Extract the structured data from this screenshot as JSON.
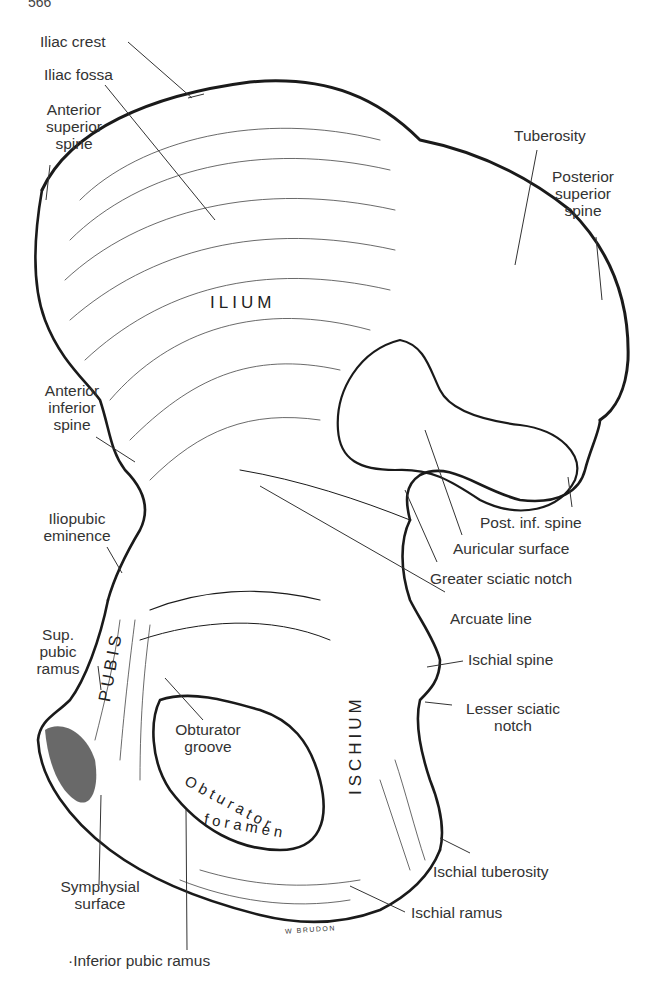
{
  "figure": {
    "page_number_fragment": "566",
    "signature": "W BRUDON",
    "colors": {
      "ink": "#1a1a1a",
      "label_text": "#333333",
      "background": "#ffffff"
    }
  },
  "regions": [
    {
      "id": "ilium",
      "text": "ILIUM"
    },
    {
      "id": "pubis",
      "text": "PUBIS"
    },
    {
      "id": "ischium",
      "text": "ISCHIUM"
    },
    {
      "id": "obturator-foramen",
      "line1": "Obturator",
      "line2": "foramen"
    }
  ],
  "labels": {
    "iliac_crest": "Iliac crest",
    "iliac_fossa": "Iliac fossa",
    "anterior_superior_spine": [
      "Anterior",
      "superior",
      "spine"
    ],
    "tuberosity": "Tuberosity",
    "posterior_superior_spine": [
      "Posterior",
      "superior",
      "spine"
    ],
    "anterior_inferior_spine": [
      "Anterior",
      "inferior",
      "spine"
    ],
    "iliopubic_eminence": [
      "Iliopubic",
      "eminence"
    ],
    "post_inf_spine": "Post. inf. spine",
    "auricular_surface": "Auricular surface",
    "greater_sciatic_notch": "Greater sciatic notch",
    "arcuate_line": "Arcuate line",
    "sup_pubic_ramus": [
      "Sup.",
      "pubic",
      "ramus"
    ],
    "ischial_spine": "Ischial spine",
    "lesser_sciatic_notch": [
      "Lesser sciatic",
      "notch"
    ],
    "obturator_groove": [
      "Obturator",
      "groove"
    ],
    "ischial_tuberosity": "Ischial tuberosity",
    "symphysial_surface": [
      "Symphysial",
      "surface"
    ],
    "ischial_ramus": "Ischial ramus",
    "inferior_pubic_ramus": "·Inferior pubic ramus"
  }
}
